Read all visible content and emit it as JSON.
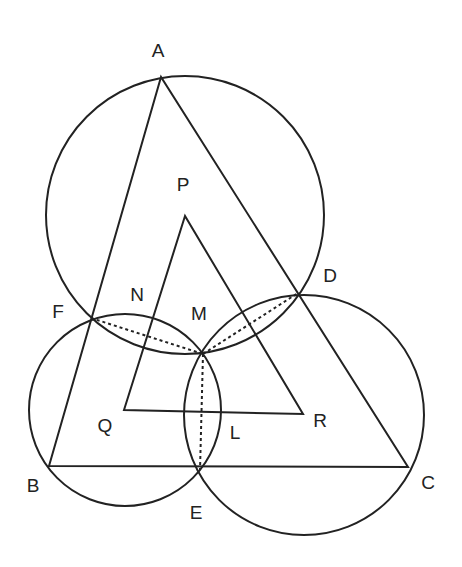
{
  "diagram": {
    "type": "geometry",
    "stroke_color": "#222222",
    "background": "#ffffff",
    "points": {
      "A": {
        "x": 161,
        "y": 77
      },
      "B": {
        "x": 49,
        "y": 466
      },
      "C": {
        "x": 408,
        "y": 467
      },
      "D": {
        "x": 298,
        "y": 293
      },
      "E": {
        "x": 200,
        "y": 470
      },
      "F": {
        "x": 91,
        "y": 318
      },
      "M": {
        "x": 203,
        "y": 354
      },
      "P": {
        "x": 185,
        "y": 216
      },
      "Q": {
        "x": 124,
        "y": 410
      },
      "R": {
        "x": 303,
        "y": 414
      }
    },
    "labels": [
      {
        "text": "A",
        "x": 158,
        "y": 50
      },
      {
        "text": "P",
        "x": 183,
        "y": 184
      },
      {
        "text": "D",
        "x": 330,
        "y": 275
      },
      {
        "text": "N",
        "x": 137,
        "y": 294
      },
      {
        "text": "F",
        "x": 58,
        "y": 311
      },
      {
        "text": "M",
        "x": 199,
        "y": 313
      },
      {
        "text": "Q",
        "x": 105,
        "y": 425
      },
      {
        "text": "R",
        "x": 320,
        "y": 420
      },
      {
        "text": "L",
        "x": 235,
        "y": 432
      },
      {
        "text": "B",
        "x": 33,
        "y": 485
      },
      {
        "text": "E",
        "x": 196,
        "y": 512
      },
      {
        "text": "C",
        "x": 428,
        "y": 482
      }
    ],
    "triangles": [
      {
        "name": "ABC",
        "vertices": [
          "A",
          "B",
          "C"
        ]
      },
      {
        "name": "PQR",
        "vertices": [
          "P",
          "Q",
          "R"
        ]
      }
    ],
    "circles": [
      {
        "name": "circle-AFD",
        "through": [
          "A",
          "F",
          "M",
          "D"
        ],
        "cx": 185,
        "cy": 215,
        "r": 139
      },
      {
        "name": "circle-BFE",
        "through": [
          "B",
          "F",
          "M",
          "E"
        ],
        "cx": 125,
        "cy": 410,
        "r": 96
      },
      {
        "name": "circle-CDE",
        "through": [
          "C",
          "D",
          "M",
          "E"
        ],
        "cx": 304,
        "cy": 415,
        "r": 120
      }
    ],
    "dashed_segments": [
      {
        "from": "F",
        "to": "M"
      },
      {
        "from": "M",
        "to": "D"
      },
      {
        "from": "M",
        "to": "E"
      }
    ]
  }
}
